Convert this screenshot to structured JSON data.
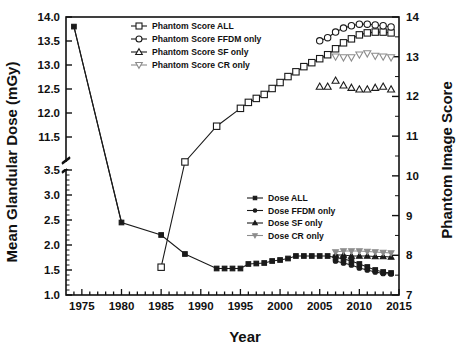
{
  "chart_data": {
    "type": "scatter",
    "title": "",
    "xlabel": "Year",
    "ylabel": "Mean Glandular Dose (mGy)",
    "y2label": "Phantom Image Score",
    "xlim": [
      1973,
      2015
    ],
    "xticks": [
      1975,
      1980,
      1985,
      1990,
      1995,
      2000,
      2005,
      2010,
      2015
    ],
    "xtick_labels": [
      "1975",
      "1980",
      "1985",
      "1990",
      "1995",
      "2000",
      "2005",
      "2010",
      "2015"
    ],
    "x_minor_step": 1,
    "y_broken_axis": true,
    "y_lower_range": [
      1.0,
      3.5
    ],
    "y_lower_ticks": [
      1.0,
      1.5,
      2.0,
      2.5,
      3.0,
      3.5
    ],
    "y_lower_tick_labels": [
      "1.0",
      "1.5",
      "2.0",
      "2.5",
      "3.0",
      "3.5"
    ],
    "y_upper_range": [
      11.0,
      14.0
    ],
    "y_upper_ticks": [
      11.5,
      12.0,
      12.5,
      13.0,
      13.5,
      14.0
    ],
    "y_upper_tick_labels": [
      "11.5",
      "12.0",
      "12.5",
      "13.0",
      "13.5",
      "14.0"
    ],
    "y2lim": [
      7,
      14
    ],
    "y2ticks": [
      7,
      8,
      9,
      10,
      11,
      12,
      13,
      14
    ],
    "y2tick_labels": [
      "7",
      "8",
      "9",
      "10",
      "11",
      "12",
      "13",
      "14"
    ],
    "grid": false,
    "legend_position": [
      "top-center",
      "middle-right"
    ],
    "series": [
      {
        "name": "Phantom Score ALL",
        "axis": "right",
        "marker": "open-square",
        "color": "#1a1a1a",
        "line": true,
        "x": [
          1985,
          1988,
          1992,
          1995,
          1996,
          1997,
          1998,
          1999,
          2000,
          2001,
          2002,
          2003,
          2004,
          2005,
          2006,
          2007,
          2008,
          2009,
          2010,
          2011,
          2012,
          2013,
          2014
        ],
        "y": [
          7.7,
          10.35,
          11.25,
          11.7,
          11.85,
          11.95,
          12.05,
          12.2,
          12.35,
          12.5,
          12.62,
          12.75,
          12.85,
          12.95,
          13.05,
          13.2,
          13.35,
          13.45,
          13.55,
          13.6,
          13.62,
          13.62,
          13.6
        ]
      },
      {
        "name": "Phantom Score FFDM only",
        "axis": "right",
        "marker": "open-circle",
        "color": "#1a1a1a",
        "line": true,
        "x": [
          2005,
          2006,
          2007,
          2008,
          2009,
          2010,
          2011,
          2012,
          2013,
          2014
        ],
        "y": [
          13.4,
          13.48,
          13.62,
          13.72,
          13.78,
          13.82,
          13.82,
          13.8,
          13.78,
          13.75
        ]
      },
      {
        "name": "Phantom Score SF only",
        "axis": "right",
        "marker": "open-triangle-up",
        "color": "#1a1a1a",
        "line": false,
        "x": [
          2005,
          2006,
          2007,
          2008,
          2009,
          2010,
          2011,
          2012,
          2013,
          2014
        ],
        "y": [
          12.25,
          12.25,
          12.4,
          12.28,
          12.22,
          12.18,
          12.18,
          12.22,
          12.25,
          12.18
        ]
      },
      {
        "name": "Phantom Score CR only",
        "axis": "right",
        "marker": "open-triangle-down",
        "color": "#8c8c8c",
        "line": false,
        "x": [
          2007,
          2008,
          2009,
          2010,
          2011,
          2012,
          2013,
          2014
        ],
        "y": [
          13.0,
          12.98,
          12.98,
          13.05,
          13.08,
          13.02,
          13.0,
          12.98
        ]
      },
      {
        "name": "Dose ALL",
        "axis": "left",
        "marker": "filled-square",
        "color": "#1a1a1a",
        "line": true,
        "x": [
          1974,
          1980,
          1985,
          1988,
          1992,
          1993,
          1994,
          1995,
          1996,
          1997,
          1998,
          1999,
          2000,
          2001,
          2002,
          2003,
          2004,
          2005,
          2006,
          2007,
          2008,
          2009,
          2010,
          2011,
          2012,
          2013,
          2014
        ],
        "y": [
          13.8,
          2.45,
          2.2,
          1.82,
          1.53,
          1.53,
          1.53,
          1.53,
          1.62,
          1.63,
          1.64,
          1.68,
          1.7,
          1.73,
          1.78,
          1.78,
          1.78,
          1.78,
          1.78,
          1.75,
          1.72,
          1.68,
          1.62,
          1.56,
          1.5,
          1.46,
          1.44
        ]
      },
      {
        "name": "Dose FFDM only",
        "axis": "left",
        "marker": "filled-circle",
        "color": "#1a1a1a",
        "line": true,
        "x": [
          2007,
          2008,
          2009,
          2010,
          2011,
          2012,
          2013,
          2014
        ],
        "y": [
          1.68,
          1.64,
          1.6,
          1.54,
          1.5,
          1.46,
          1.43,
          1.42
        ]
      },
      {
        "name": "Dose SF only",
        "axis": "left",
        "marker": "filled-triangle-up",
        "color": "#1a1a1a",
        "line": true,
        "x": [
          2007,
          2008,
          2009,
          2010,
          2011,
          2012,
          2013,
          2014
        ],
        "y": [
          1.8,
          1.8,
          1.78,
          1.78,
          1.78,
          1.77,
          1.77,
          1.76
        ]
      },
      {
        "name": "Dose CR only",
        "axis": "left",
        "marker": "filled-triangle-down",
        "color": "#8c8c8c",
        "line": true,
        "x": [
          2007,
          2008,
          2009,
          2010,
          2011,
          2012,
          2013,
          2014
        ],
        "y": [
          1.86,
          1.88,
          1.88,
          1.88,
          1.87,
          1.86,
          1.85,
          1.84
        ]
      }
    ],
    "legend_top": [
      {
        "label": "Phantom Score ALL",
        "marker": "open-square",
        "color": "#1a1a1a"
      },
      {
        "label": "Phantom Score FFDM only",
        "marker": "open-circle",
        "color": "#1a1a1a"
      },
      {
        "label": "Phantom Score SF only",
        "marker": "open-triangle-up",
        "color": "#1a1a1a"
      },
      {
        "label": "Phantom Score CR only",
        "marker": "open-triangle-down",
        "color": "#8c8c8c"
      }
    ],
    "legend_bottom": [
      {
        "label": "Dose ALL",
        "marker": "filled-square",
        "color": "#1a1a1a"
      },
      {
        "label": "Dose FFDM only",
        "marker": "filled-circle",
        "color": "#1a1a1a"
      },
      {
        "label": "Dose SF only",
        "marker": "filled-triangle-up",
        "color": "#1a1a1a"
      },
      {
        "label": "Dose CR only",
        "marker": "filled-triangle-down",
        "color": "#8c8c8c"
      }
    ]
  }
}
